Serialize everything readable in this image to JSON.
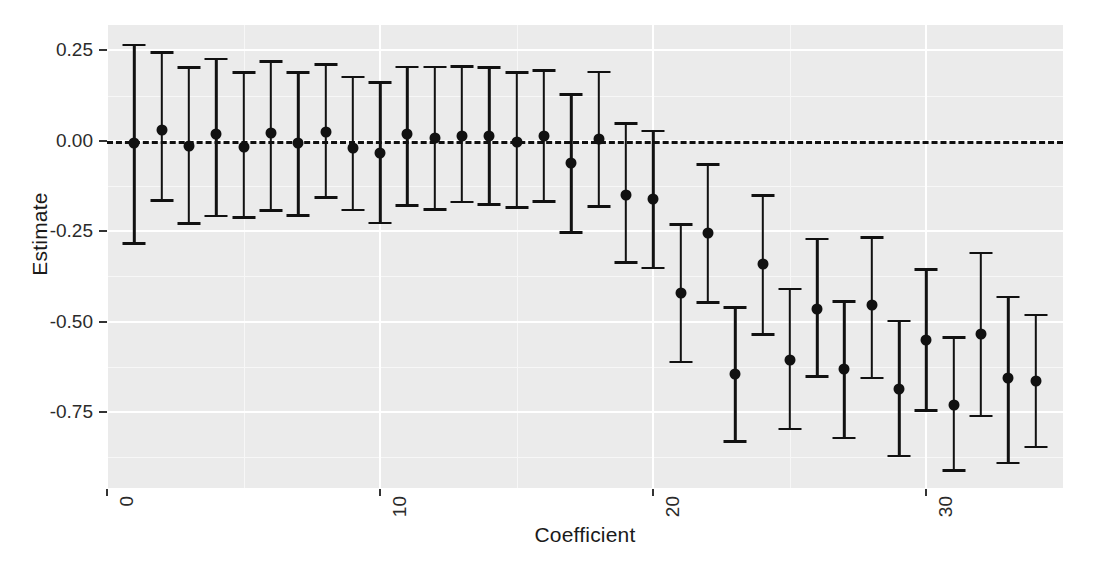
{
  "chart_data": {
    "type": "scatter",
    "subtype": "coefficient-plot-with-error-bars",
    "title": "",
    "xlabel": "Coefficient",
    "ylabel": "Estimate",
    "xlim": [
      0,
      35
    ],
    "ylim": [
      -0.96,
      0.32
    ],
    "x_ticks": [
      0,
      10,
      20,
      30
    ],
    "x_tick_labels": [
      "0",
      "10",
      "20",
      "30"
    ],
    "x_minor_ticks": [
      5,
      15,
      25,
      35
    ],
    "y_ticks": [
      0.25,
      0.0,
      -0.25,
      -0.5,
      -0.75
    ],
    "y_tick_labels": [
      "0.25",
      "0.00",
      "-0.25",
      "-0.50",
      "-0.75"
    ],
    "y_minor_ticks": [
      0.125,
      -0.125,
      -0.375,
      -0.625,
      -0.875
    ],
    "grid": true,
    "legend": "none",
    "reference_line": {
      "y": 0.0,
      "style": "dashed",
      "color": "#111111"
    },
    "panel_background": "#ebebeb",
    "grid_color": "#ffffff",
    "point_color": "#111111",
    "x": [
      1,
      2,
      3,
      4,
      5,
      6,
      7,
      8,
      9,
      10,
      11,
      12,
      13,
      14,
      15,
      16,
      17,
      18,
      19,
      20,
      21,
      22,
      23,
      24,
      25,
      26,
      27,
      28,
      29,
      30,
      31,
      32,
      33,
      34
    ],
    "estimates": [
      -0.005,
      0.03,
      -0.015,
      0.02,
      -0.017,
      0.022,
      -0.007,
      0.024,
      -0.02,
      -0.033,
      0.018,
      0.007,
      0.013,
      0.012,
      -0.003,
      0.013,
      -0.062,
      0.004,
      -0.15,
      -0.16,
      -0.42,
      -0.255,
      -0.645,
      -0.34,
      -0.605,
      -0.465,
      -0.63,
      -0.455,
      -0.685,
      -0.55,
      -0.73,
      -0.535,
      -0.655,
      -0.665
    ],
    "ci_low": [
      -0.287,
      -0.168,
      -0.232,
      -0.212,
      -0.215,
      -0.196,
      -0.21,
      -0.16,
      -0.195,
      -0.231,
      -0.182,
      -0.194,
      -0.173,
      -0.18,
      -0.188,
      -0.172,
      -0.258,
      -0.185,
      -0.34,
      -0.355,
      -0.615,
      -0.45,
      -0.835,
      -0.54,
      -0.8,
      -0.655,
      -0.825,
      -0.66,
      -0.875,
      -0.75,
      -0.915,
      -0.765,
      -0.895,
      -0.85
    ],
    "ci_high": [
      0.268,
      0.248,
      0.206,
      0.23,
      0.193,
      0.222,
      0.192,
      0.215,
      0.18,
      0.165,
      0.208,
      0.208,
      0.209,
      0.206,
      0.192,
      0.197,
      0.132,
      0.194,
      0.052,
      0.031,
      -0.228,
      -0.062,
      -0.458,
      -0.148,
      -0.406,
      -0.268,
      -0.441,
      -0.264,
      -0.495,
      -0.352,
      -0.54,
      -0.307,
      -0.428,
      -0.478
    ]
  },
  "axes": {
    "x_title": "Coefficient",
    "y_title": "Estimate"
  }
}
